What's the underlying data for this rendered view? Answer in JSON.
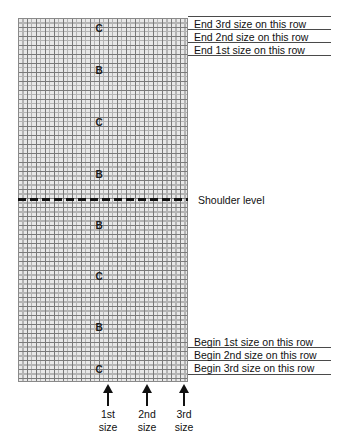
{
  "chart_title": "Knitting shoulder shaping chart",
  "grid": {
    "background_color": "#e9e9e9",
    "minor_line_color": "#b4b4b4",
    "major_line_color": "#7a7a7a",
    "columns": 38,
    "rows": 81
  },
  "row_markers": [
    {
      "label": "C",
      "x": 99,
      "y": 29
    },
    {
      "label": "B",
      "x": 99,
      "y": 71
    },
    {
      "label": "C",
      "x": 99,
      "y": 123
    },
    {
      "label": "B",
      "x": 99,
      "y": 175
    },
    {
      "label": "B",
      "x": 99,
      "y": 226
    },
    {
      "label": "C",
      "x": 99,
      "y": 277
    },
    {
      "label": "B",
      "x": 99,
      "y": 328
    },
    {
      "label": "C",
      "x": 99,
      "y": 370
    }
  ],
  "shoulder": {
    "label": "Shoulder level",
    "line_y": 199,
    "label_x": 198,
    "label_y": 194,
    "line_color": "#111111",
    "style": "dashed"
  },
  "top_callouts": [
    {
      "text": "End 3rd size on this row",
      "y": 18
    },
    {
      "text": "End 2nd size on this row",
      "y": 31
    },
    {
      "text": "End 1st size on this row",
      "y": 44
    }
  ],
  "top_rules": [
    {
      "y": 16
    },
    {
      "y": 29
    },
    {
      "y": 42
    },
    {
      "y": 55
    }
  ],
  "bottom_callouts": [
    {
      "text": "Begin 1st size on this row",
      "y": 336
    },
    {
      "text": "Begin 2nd size on this row",
      "y": 349
    },
    {
      "text": "Begin 3rd size on this row",
      "y": 362
    }
  ],
  "bottom_rules": [
    {
      "y": 347
    },
    {
      "y": 360
    },
    {
      "y": 374
    }
  ],
  "size_arrows": [
    {
      "line1": "1st",
      "line2": "size",
      "x": 108
    },
    {
      "line1": "2nd",
      "line2": "size",
      "x": 147
    },
    {
      "line1": "3rd",
      "line2": "size",
      "x": 184
    }
  ],
  "colors": {
    "text": "#111111",
    "rule": "#4a4a4a",
    "arrow": "#111111"
  }
}
